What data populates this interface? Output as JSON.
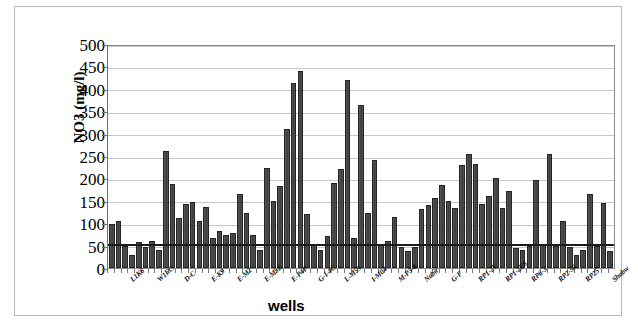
{
  "chart_data": {
    "type": "bar",
    "title": "",
    "xlabel": "wells",
    "ylabel": "NO3 (mg/l)",
    "ylim": [
      0,
      500
    ],
    "ytick_values": [
      0,
      50,
      100,
      150,
      200,
      250,
      300,
      350,
      400,
      450,
      500
    ],
    "ytick_labels": [
      "0",
      "50",
      "100",
      "150",
      "200",
      "250",
      "300",
      "350",
      "400",
      "450",
      "500"
    ],
    "grid": true,
    "legend": false,
    "bar_color": "#4a4a4a",
    "reference_line": {
      "value": 50,
      "color": "#1b1b1b",
      "label": ""
    },
    "xtick_labels": [
      "L1K6",
      "W1EC",
      "D-C",
      "E-K9",
      "E-M2",
      "E-M5K",
      "E-P4P",
      "G-I-4C",
      "L-M59",
      "I-M04",
      "M-P3-8",
      "Nabir",
      "G-F",
      "RP1-2Y",
      "RP1-2E8",
      "RP6-3",
      "RP2-50",
      "RP25",
      "Shabw"
    ],
    "values": [
      98,
      104,
      50,
      30,
      58,
      46,
      61,
      40,
      261,
      187,
      111,
      144,
      147,
      105,
      136,
      67,
      82,
      74,
      79,
      166,
      122,
      73,
      41,
      224,
      149,
      182,
      310,
      414,
      440,
      120,
      52,
      41,
      72,
      190,
      222,
      419,
      67,
      364,
      122,
      242,
      53,
      60,
      113,
      48,
      37,
      48,
      131,
      140,
      156,
      186,
      149,
      133,
      231,
      254,
      232,
      142,
      160,
      202,
      135,
      171,
      45,
      40,
      50,
      196,
      52,
      254,
      50,
      106,
      48,
      29,
      40,
      166,
      50,
      145,
      38
    ]
  },
  "axes": {
    "y_title": "NO3 (mg/l)",
    "x_title": "wells"
  }
}
